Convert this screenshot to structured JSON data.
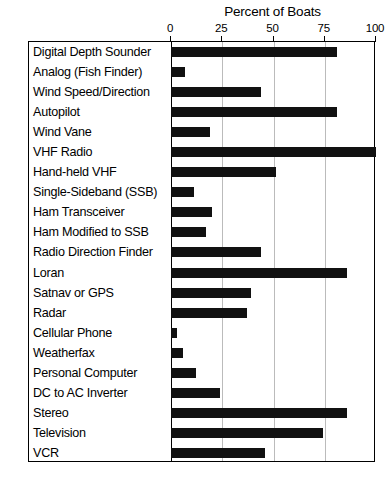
{
  "chart_data": {
    "type": "bar",
    "orientation": "horizontal",
    "title": "Percent of Boats",
    "xlabel": "Percent of Boats",
    "ylabel": "",
    "xlim": [
      0,
      100
    ],
    "xticks": [
      0,
      25,
      50,
      75,
      100
    ],
    "xtick_labels": [
      "0",
      "25",
      "50",
      "75",
      "100"
    ],
    "grid": true,
    "grid_axis": "x",
    "legend": false,
    "bar_color": "#111111",
    "categories": [
      "Digital Depth Sounder",
      "Analog (Fish Finder)",
      "Wind Speed/Direction",
      "Autopilot",
      "Wind Vane",
      "VHF Radio",
      "Hand-held VHF",
      "Single-Sideband (SSB)",
      "Ham Transceiver",
      "Ham Modified to SSB",
      "Radio Direction Finder",
      "Loran",
      "Satnav or GPS",
      "Radar",
      "Cellular Phone",
      "Weatherfax",
      "Personal Computer",
      "DC to AC Inverter",
      "Stereo",
      "Television",
      "VCR"
    ],
    "values": [
      81,
      7,
      44,
      81,
      19,
      100,
      51,
      11,
      20,
      17,
      44,
      86,
      39,
      37,
      3,
      6,
      12,
      24,
      86,
      74,
      46
    ]
  }
}
